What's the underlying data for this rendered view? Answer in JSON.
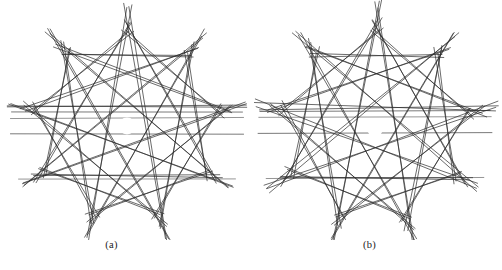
{
  "figure": {
    "background_color": "#ffffff",
    "line_color": "#2b2b2b",
    "line_width": 0.7,
    "width": 502,
    "height": 270,
    "panels": [
      {
        "id": "a",
        "caption": "(a)",
        "center_x": 127,
        "center_y": 126,
        "outer_radius": 112,
        "inner_hole_radius": 8.5,
        "points": 9,
        "step": 4,
        "rings": [
          {
            "step": 4,
            "radius": 112,
            "jitter": 1.5,
            "overshoot": 9
          },
          {
            "step": 4,
            "radius": 112,
            "jitter": 1.5,
            "overshoot": 9,
            "rotate": 0.9
          },
          {
            "step": 3,
            "radius": 100,
            "jitter": 1.2,
            "overshoot": 7
          },
          {
            "step": 3,
            "radius": 100,
            "jitter": 1.2,
            "overshoot": 7,
            "rotate": 1.1
          },
          {
            "step": 2,
            "radius": 92,
            "jitter": 1.0,
            "overshoot": 6
          },
          {
            "step": 2,
            "radius": 92,
            "jitter": 1.0,
            "overshoot": 6,
            "rotate": 1.4
          }
        ],
        "horizontal_chords": [
          112,
          118,
          134,
          179
        ]
      },
      {
        "id": "b",
        "caption": "(b)",
        "center_x": 124,
        "center_y": 127,
        "outer_radius": 112,
        "inner_hole_radius": 9,
        "points": 9,
        "step": 4,
        "rings": [
          {
            "step": 4,
            "radius": 112,
            "jitter": 2.0,
            "overshoot": 10
          },
          {
            "step": 4,
            "radius": 112,
            "jitter": 2.0,
            "overshoot": 10,
            "rotate": 1.3
          },
          {
            "step": 3,
            "radius": 101,
            "jitter": 1.6,
            "overshoot": 8
          },
          {
            "step": 3,
            "radius": 101,
            "jitter": 1.6,
            "overshoot": 8,
            "rotate": 1.6
          },
          {
            "step": 2,
            "radius": 93,
            "jitter": 1.3,
            "overshoot": 6
          },
          {
            "step": 2,
            "radius": 93,
            "jitter": 1.3,
            "overshoot": 6,
            "rotate": 2.0
          }
        ],
        "horizontal_chords": [
          111,
          117,
          133,
          178
        ]
      }
    ]
  }
}
